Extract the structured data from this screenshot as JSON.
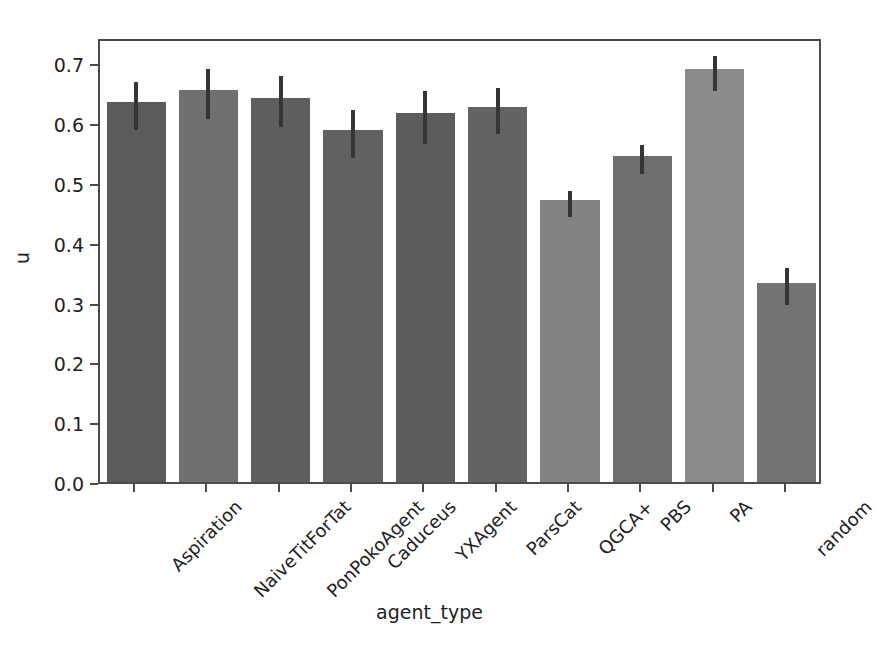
{
  "chart_data": {
    "type": "bar",
    "title": "",
    "xlabel": "agent_type",
    "ylabel": "u",
    "categories": [
      "Aspiration",
      "NaiveTitForTat",
      "PonPokoAgent",
      "Caduceus",
      "YXAgent",
      "ParsCat",
      "QGCA+",
      "PBS",
      "PA",
      "random"
    ],
    "values": [
      0.636,
      0.656,
      0.642,
      0.588,
      0.617,
      0.627,
      0.472,
      0.545,
      0.69,
      0.333
    ],
    "errors_low": [
      0.596,
      0.613,
      0.6,
      0.548,
      0.572,
      0.588,
      0.45,
      0.521,
      0.661,
      0.302
    ],
    "errors_high": [
      0.676,
      0.697,
      0.685,
      0.629,
      0.661,
      0.665,
      0.494,
      0.57,
      0.719,
      0.364
    ],
    "ylim": [
      0.0,
      0.744
    ],
    "xlim_categories": 10,
    "yticks": [
      "0.0",
      "0.1",
      "0.2",
      "0.3",
      "0.4",
      "0.5",
      "0.6",
      "0.7"
    ],
    "ytick_values": [
      0.0,
      0.1,
      0.2,
      0.3,
      0.4,
      0.5,
      0.6,
      0.7
    ],
    "grid": false,
    "legend": "none",
    "xtick_rotation": -45,
    "bar_colors": [
      "#5b5b5b",
      "#707070",
      "#5f5f5f",
      "#616161",
      "#5c5c5c",
      "#636363",
      "#838383",
      "#6e6e6e",
      "#8b8b8b",
      "#737373"
    ],
    "error_color": "#353535",
    "axis_color": "#4c4c4c",
    "background_color": "#ffffff"
  },
  "axes": {
    "y_label_text": "u",
    "x_label_text": "agent_type"
  }
}
